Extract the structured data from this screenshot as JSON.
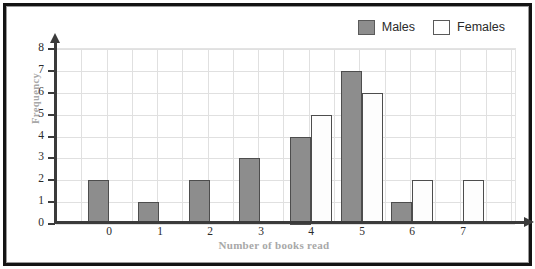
{
  "legend": {
    "items": [
      {
        "label": "Males",
        "swatch": "males",
        "color": "#8d8d8d"
      },
      {
        "label": "Females",
        "swatch": "females",
        "color": "#ffffff"
      }
    ]
  },
  "chart_data": {
    "type": "bar",
    "title": "",
    "xlabel": "Number of books read",
    "ylabel": "Frequency",
    "categories": [
      "0",
      "1",
      "2",
      "3",
      "4",
      "5",
      "6",
      "7"
    ],
    "series": [
      {
        "name": "Males",
        "color": "#8d8d8d",
        "values": [
          2,
          1,
          2,
          3,
          4,
          7,
          1,
          0
        ]
      },
      {
        "name": "Females",
        "color": "#ffffff",
        "values": [
          0,
          0,
          0,
          0,
          5,
          6,
          2,
          2
        ]
      }
    ],
    "ylim": [
      0,
      8
    ],
    "ytick_labels": [
      "0",
      "1",
      "2",
      "3",
      "4",
      "5",
      "6",
      "7",
      "8"
    ],
    "grid": true,
    "legend_position": "top-right"
  }
}
